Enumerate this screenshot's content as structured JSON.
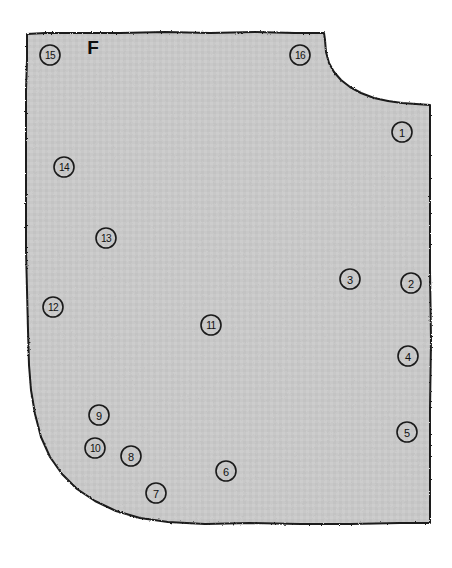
{
  "figure": {
    "region_letter": "F",
    "region_letter_position": {
      "x": 93,
      "y": 47
    },
    "outline_color": "#1a1a1a",
    "fill_color": "#c8c8c8",
    "background_color": "#ffffff",
    "outline_width": 2.0,
    "canvas": {
      "width": 452,
      "height": 568
    },
    "shape_description": "irregular quadrilateral region with concave notch at top-right, rounded convex corner at bottom-left, square bottom-right corner",
    "shape_path": "M 27,34 L 45,33 L 80,33 L 120,33 L 165,32 L 210,33 L 255,32 L 295,33 L 324,33 L 325,40 L 326,52 L 329,63 L 334,72 L 341,80 L 350,87 L 361,93 L 374,98 L 388,101 L 402,103 L 416,104 L 430,105 L 430,140 L 430,200 L 430,270 L 431,340 L 430,410 L 430,470 L 430,523 L 400,523 L 350,524 L 300,524 L 250,523 L 205,524 L 168,522 L 140,518 L 116,511 L 95,501 L 77,489 L 62,474 L 50,457 L 41,437 L 35,414 L 31,390 L 29,365 L 28,330 L 27,290 L 26,250 L 26,210 L 26,170 L 26,130 L 26,90 L 27,60 Z"
  },
  "markers": [
    {
      "id": "1",
      "label": "1",
      "x": 402,
      "y": 132,
      "r": 10
    },
    {
      "id": "2",
      "label": "2",
      "x": 411,
      "y": 283,
      "r": 10
    },
    {
      "id": "3",
      "label": "3",
      "x": 350,
      "y": 279,
      "r": 10
    },
    {
      "id": "4",
      "label": "4",
      "x": 408,
      "y": 356,
      "r": 10
    },
    {
      "id": "5",
      "label": "5",
      "x": 407,
      "y": 432,
      "r": 10
    },
    {
      "id": "6",
      "label": "6",
      "x": 226,
      "y": 471,
      "r": 10
    },
    {
      "id": "7",
      "label": "7",
      "x": 156,
      "y": 493,
      "r": 10
    },
    {
      "id": "8",
      "label": "8",
      "x": 131,
      "y": 456,
      "r": 10
    },
    {
      "id": "9",
      "label": "9",
      "x": 99,
      "y": 415,
      "r": 10
    },
    {
      "id": "10",
      "label": "10",
      "x": 95,
      "y": 448,
      "r": 10
    },
    {
      "id": "11",
      "label": "11",
      "x": 211,
      "y": 325,
      "r": 10
    },
    {
      "id": "12",
      "label": "12",
      "x": 53,
      "y": 307,
      "r": 10
    },
    {
      "id": "13",
      "label": "13",
      "x": 106,
      "y": 238,
      "r": 10
    },
    {
      "id": "14",
      "label": "14",
      "x": 64,
      "y": 167,
      "r": 10
    },
    {
      "id": "15",
      "label": "15",
      "x": 50,
      "y": 55,
      "r": 10
    },
    {
      "id": "16",
      "label": "16",
      "x": 300,
      "y": 55,
      "r": 10
    }
  ]
}
